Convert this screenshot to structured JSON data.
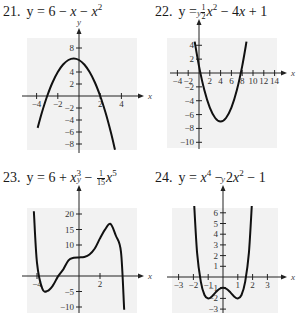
{
  "titles": [
    {
      "num": "21.",
      "expr_html_parts": [
        "y = 6 − ",
        "x",
        " − ",
        "x",
        "2"
      ]
    },
    {
      "num": "22.",
      "expr_html_parts": [
        "y = ",
        "1",
        "2",
        "x",
        "2",
        " − 4",
        "x",
        " + 1"
      ]
    },
    {
      "num": "23.",
      "expr_html_parts": [
        "y = 6 + ",
        "x",
        "3",
        " − ",
        "1",
        "15",
        "x",
        "5"
      ]
    },
    {
      "num": "24.",
      "expr_html_parts": [
        "y = ",
        "x",
        "4",
        " − 2",
        "x",
        "2",
        " − 1"
      ]
    }
  ],
  "chart_data": [
    {
      "type": "line",
      "title": "21. y = 6 − x − x^2",
      "xlabel": "x",
      "ylabel": "y",
      "x_ticks": [
        -4,
        -2,
        2,
        4
      ],
      "y_ticks": [
        8,
        4,
        2,
        -2,
        -4,
        -6,
        -8
      ],
      "xlim": [
        -4.5,
        4.5
      ],
      "ylim": [
        -9,
        10
      ],
      "series": [
        {
          "name": "y = 6 - x - x^2",
          "x": [
            -3.9,
            -3.5,
            -3,
            -2.5,
            -2,
            -1.5,
            -1,
            -0.5,
            0,
            0.5,
            1,
            1.5,
            2,
            2.5,
            3,
            3.4
          ],
          "values": [
            -5.31,
            -2.75,
            0,
            2.25,
            4,
            5.25,
            6,
            6.25,
            6,
            5.25,
            4,
            2.25,
            0,
            -2.75,
            -6,
            -8.96
          ]
        }
      ],
      "grid": false
    },
    {
      "type": "line",
      "title": "22. y = (1/2)x^2 − 4x + 1",
      "xlabel": "x",
      "ylabel": "y",
      "x_ticks": [
        -4,
        -2,
        2,
        4,
        6,
        8,
        10,
        12,
        14
      ],
      "y_ticks": [
        4,
        2,
        -2,
        -4,
        -6,
        -8,
        -10
      ],
      "xlim": [
        -4,
        15
      ],
      "ylim": [
        -11,
        5
      ],
      "series": [
        {
          "name": "y = 0.5x^2 - 4x + 1",
          "x": [
            -0.8,
            0,
            1,
            2,
            3,
            4,
            5,
            6,
            7,
            8,
            8.8
          ],
          "values": [
            4.52,
            1,
            -2.5,
            -5,
            -6.5,
            -7,
            -6.5,
            -5,
            -2.5,
            1,
            4.52
          ]
        }
      ],
      "grid": false
    },
    {
      "type": "line",
      "title": "23. y = 6 + x^3 − (1/15)x^5",
      "xlabel": "x",
      "ylabel": "y",
      "x_ticks": [
        -4,
        2
      ],
      "y_ticks": [
        20,
        15,
        10,
        -5,
        -10
      ],
      "xlim": [
        -4.5,
        4.5
      ],
      "ylim": [
        -11,
        24
      ],
      "series": [
        {
          "name": "y = 6 + x^3 - x^5/15",
          "x": [
            -4.3,
            -4,
            -3.5,
            -3,
            -2.5,
            -2,
            -1.5,
            -1,
            -0.5,
            0,
            0.5,
            1,
            1.5,
            2,
            2.5,
            3,
            3.5,
            4,
            4.3
          ],
          "values": [
            20.9,
            4.27,
            -4.05,
            -4.8,
            -3.12,
            -0.13,
            2.13,
            5.07,
            5.88,
            6,
            6.12,
            6.93,
            8.88,
            12.13,
            15.12,
            16.8,
            13.05,
            7.73,
            -10.9
          ]
        }
      ],
      "grid": false
    },
    {
      "type": "line",
      "title": "24. y = x^4 − 2x^2 − 1",
      "xlabel": "x",
      "ylabel": "y",
      "x_ticks": [
        -3,
        -2,
        -1,
        1,
        2,
        3
      ],
      "y_ticks": [
        6,
        5,
        4,
        3,
        2,
        1,
        -1,
        -2,
        -3
      ],
      "xlim": [
        -3.5,
        3.5
      ],
      "ylim": [
        -3.2,
        7
      ],
      "series": [
        {
          "name": "y = x^4 - 2x^2 - 1",
          "x": [
            -1.95,
            -1.75,
            -1.5,
            -1.25,
            -1,
            -0.75,
            -0.5,
            -0.25,
            0,
            0.25,
            0.5,
            0.75,
            1,
            1.25,
            1.5,
            1.75,
            1.95
          ],
          "values": [
            6.85,
            2.25,
            -0.44,
            -1.68,
            -2,
            -1.81,
            -1.44,
            -1.12,
            -1,
            -1.12,
            -1.44,
            -1.81,
            -2,
            -1.68,
            -0.44,
            2.25,
            6.85
          ]
        }
      ],
      "grid": false
    }
  ],
  "colors": {
    "curve": "#111111",
    "panel_bg": "#f2f2f2",
    "axis": "#222222"
  }
}
